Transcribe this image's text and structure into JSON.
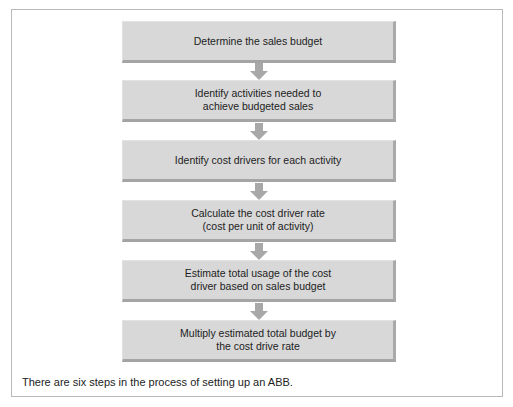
{
  "diagram": {
    "type": "flowchart",
    "direction": "top-to-bottom",
    "steps": [
      {
        "label": "Determine the sales budget"
      },
      {
        "label": "Identify activities needed to\nachieve budgeted sales"
      },
      {
        "label": "Identify cost drivers for each activity"
      },
      {
        "label": "Calculate the cost driver rate\n(cost per unit of activity)"
      },
      {
        "label": "Estimate total usage of the cost\ndriver based on sales budget"
      },
      {
        "label": "Multiply estimated total budget by\nthe cost drive rate"
      }
    ],
    "arrows": 5,
    "colors": {
      "box_fill": "#d8d8d8",
      "box_edge": "#a8a8a8",
      "arrow": "#a8a8a8",
      "frame": "#b9b9b9"
    }
  },
  "caption": "There are six steps in the process of setting up an ABB."
}
